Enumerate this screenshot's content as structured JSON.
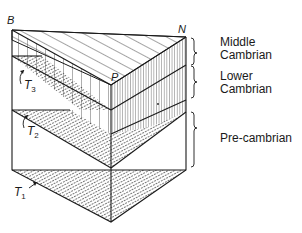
{
  "figure": {
    "type": "geological block diagram",
    "corner_labels": {
      "B": "B",
      "P": "P",
      "N": "N"
    },
    "surface_labels": [
      {
        "name": "T",
        "sub": "3"
      },
      {
        "name": "T",
        "sub": "2"
      },
      {
        "name": "T",
        "sub": "1"
      }
    ],
    "strata": [
      {
        "line1": "Middle",
        "line2": "Cambrian"
      },
      {
        "line1": "Lower",
        "line2": "Cambrian"
      },
      {
        "line1": "Pre-cambrian",
        "line2": ""
      }
    ],
    "colors": {
      "ink": "#1a1a1a",
      "background": "#ffffff"
    }
  }
}
